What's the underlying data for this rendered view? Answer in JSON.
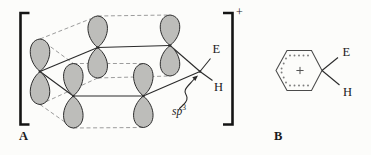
{
  "figure": {
    "labels": {
      "structure_a": "A",
      "structure_b": "B",
      "electrophile_a": "E",
      "hydrogen_a": "H",
      "electrophile_b": "E",
      "hydrogen_b": "H",
      "hybridization": "sp",
      "hybridization_sup": "3",
      "bracket_charge": "+"
    },
    "colors": {
      "lobe_fill": "#bdbdba",
      "lobe_stroke": "#2d2d2d",
      "bond": "#2a2a2a",
      "dash": "#9c9c9c",
      "bracket": "#141414",
      "hexagon": "#4a4a4a",
      "dot": "#7d7d7d",
      "plus": "#555555"
    },
    "structure_a": {
      "orbitals": [
        {
          "id": "L",
          "x": 40,
          "node": 71.5,
          "up": 39,
          "down": 104.5
        },
        {
          "id": "TM",
          "x": 97.7,
          "node": 47.5,
          "up": 16,
          "down": 78
        },
        {
          "id": "TR",
          "x": 170,
          "node": 45.5,
          "up": 15,
          "down": 76
        },
        {
          "id": "FL",
          "x": 73.3,
          "node": 96,
          "up": 63.5,
          "down": 128
        },
        {
          "id": "FR",
          "x": 143.3,
          "node": 96,
          "up": 63.5,
          "down": 127.5
        }
      ],
      "sp3_vertex": [
        200,
        71.5
      ],
      "ring_bonds": [
        [
          "L",
          "TM"
        ],
        [
          "TM",
          "TR"
        ],
        [
          "TR",
          "SP3"
        ],
        [
          "SP3",
          "FR"
        ],
        [
          "FR",
          "FL"
        ],
        [
          "FL",
          "L"
        ]
      ],
      "pi_overlap_dashes": [
        [
          "L",
          "TM",
          "up"
        ],
        [
          "TM",
          "TR",
          "up"
        ],
        [
          "L",
          "FL",
          "up"
        ],
        [
          "FL",
          "FR",
          "up"
        ],
        [
          "L",
          "TM",
          "down"
        ],
        [
          "TM",
          "TR",
          "down"
        ],
        [
          "L",
          "FL",
          "down"
        ],
        [
          "FL",
          "FR",
          "down"
        ]
      ],
      "substituent_bonds": [
        {
          "name": "bond-to-e",
          "x1": 200,
          "y1": 71.5,
          "x2": 210.5,
          "y2": 58.5
        },
        {
          "name": "bond-to-h",
          "x1": 200,
          "y1": 71.5,
          "x2": 212.5,
          "y2": 80.5
        }
      ],
      "sp3_arrow": {
        "path": "M 179.5 108.5 C 185 103.5 187.5 101 187 97.5 C 186.5 93.5 184 93.5 185.3 90 C 186.6 86.5 190.5 83.5 193.8 79.5",
        "head": "198,75.5 195.3,80.9 192.3,77.3"
      },
      "brackets": {
        "left": {
          "x": 20.5,
          "top": 13,
          "bottom": 124.5,
          "arm": 9,
          "width": 2.6
        },
        "right": {
          "x": 232.5,
          "top": 13,
          "bottom": 124.5,
          "arm": -9.5,
          "width": 2.6
        }
      }
    },
    "structure_b": {
      "hexagon": [
        [
          276,
          70.5
        ],
        [
          287,
          50.5
        ],
        [
          311.5,
          50.5
        ],
        [
          322,
          70.5
        ],
        [
          311.5,
          90.5
        ],
        [
          287,
          90.5
        ]
      ],
      "aromatic_dots": [
        [
          290,
          55.5
        ],
        [
          294.5,
          55.5
        ],
        [
          299,
          55.5
        ],
        [
          303.5,
          55.5
        ],
        [
          308,
          55.5
        ],
        [
          286,
          58.5
        ],
        [
          283.7,
          63.5
        ],
        [
          281.6,
          68.5
        ],
        [
          281.6,
          72.5
        ],
        [
          283.7,
          77.5
        ],
        [
          286,
          82.5
        ],
        [
          290,
          85.5
        ],
        [
          294.5,
          85.5
        ],
        [
          299,
          85.5
        ],
        [
          303.5,
          85.5
        ],
        [
          308,
          85.5
        ]
      ],
      "plus_center": [
        300,
        70.5
      ],
      "substituent_bonds": [
        {
          "name": "bond-to-e",
          "x1": 322,
          "y1": 70.5,
          "x2": 338,
          "y2": 57.5
        },
        {
          "name": "bond-to-h",
          "x1": 322,
          "y1": 70.5,
          "x2": 339.5,
          "y2": 85
        }
      ]
    }
  }
}
